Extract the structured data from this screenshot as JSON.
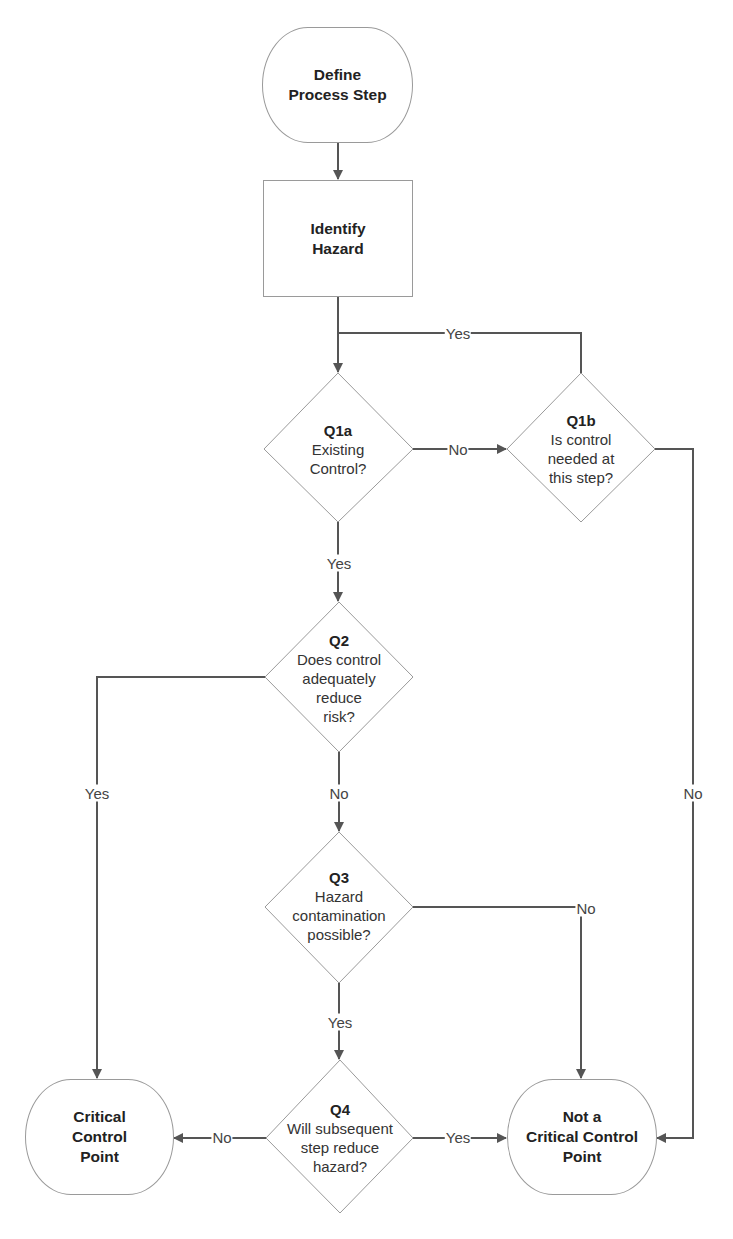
{
  "diagram": {
    "type": "flowchart",
    "colors": {
      "line": "#555555",
      "shape_border": "#9a9a9a",
      "background": "#ffffff",
      "text": "#222222"
    },
    "nodes": {
      "start": {
        "line1": "Define",
        "line2": "Process Step"
      },
      "identify": {
        "line1": "Identify",
        "line2": "Hazard"
      },
      "q1a": {
        "id": "Q1a",
        "line1": "Existing",
        "line2": "Control?"
      },
      "q1b": {
        "id": "Q1b",
        "line1": "Is control",
        "line2": "needed at",
        "line3": "this step?"
      },
      "q2": {
        "id": "Q2",
        "line1": "Does control",
        "line2": "adequately",
        "line3": "reduce",
        "line4": "risk?"
      },
      "q3": {
        "id": "Q3",
        "line1": "Hazard",
        "line2": "contamination",
        "line3": "possible?"
      },
      "q4": {
        "id": "Q4",
        "line1": "Will subsequent",
        "line2": "step reduce",
        "line3": "hazard?"
      },
      "ccp": {
        "line1": "Critical",
        "line2": "Control",
        "line3": "Point"
      },
      "not_ccp": {
        "line1": "Not a",
        "line2": "Critical Control",
        "line3": "Point"
      }
    },
    "edge_labels": {
      "q1b_yes": "Yes",
      "q1a_no": "No",
      "q1a_yes": "Yes",
      "q2_yes": "Yes",
      "q2_no": "No",
      "q1b_no": "No",
      "q3_no": "No",
      "q3_yes": "Yes",
      "q4_no": "No",
      "q4_yes": "Yes"
    }
  }
}
